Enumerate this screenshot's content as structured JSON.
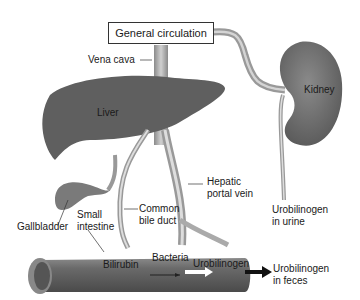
{
  "diagram": {
    "title_box": "General circulation",
    "organs": {
      "liver": "Liver",
      "kidney": "Kidney"
    },
    "labels": {
      "vena_cava": "Vena cava",
      "hepatic_portal_vein_1": "Hepatic",
      "hepatic_portal_vein_2": "portal vein",
      "common_bile_duct_1": "Common",
      "common_bile_duct_2": "bile duct",
      "small_intestine_1": "Small",
      "small_intestine_2": "intestine",
      "gallbladder": "Gallbladder",
      "bilirubin": "Bilirubin",
      "bacteria": "Bacteria",
      "urobilinogen": "Urobilinogen",
      "urine_1": "Urobilinogen",
      "urine_2": "in urine",
      "feces_1": "Urobilinogen",
      "feces_2": "in feces"
    },
    "colors": {
      "organ": "#5a5a5a",
      "vessel": "#a8a8a8",
      "intestine": "#6a6a6a"
    }
  }
}
